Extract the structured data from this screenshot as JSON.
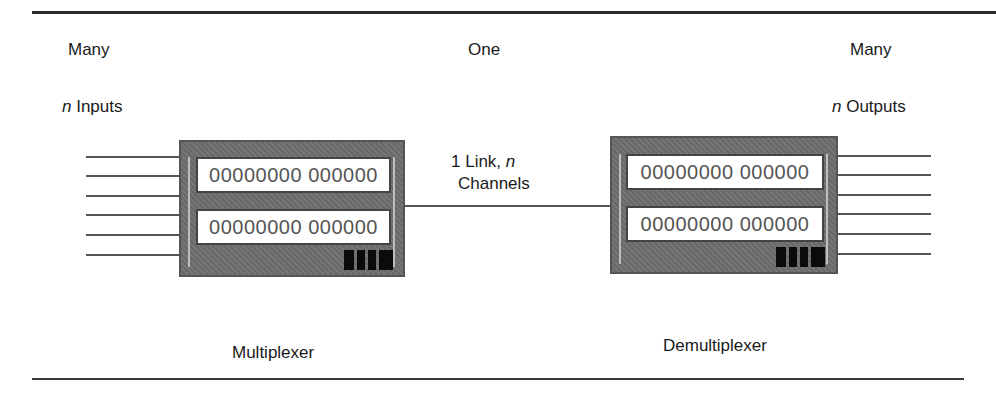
{
  "labels": {
    "left_top": "Many",
    "center_top": "One",
    "right_top": "Many",
    "inputs_prefix": "n",
    "inputs_text": " Inputs",
    "outputs_prefix": "n",
    "outputs_text": " Outputs",
    "link_line1_text": "1 Link, ",
    "link_line1_var": "n",
    "link_line2": "Channels",
    "mux_caption": "Multiplexer",
    "demux_caption": "Demultiplexer"
  },
  "multiplexer": {
    "panel1": "00000000 000000",
    "panel2": "00000000 000000",
    "input_line_count": 6
  },
  "demultiplexer": {
    "panel1": "00000000 000000",
    "panel2": "00000000 000000",
    "output_line_count": 6
  },
  "colors": {
    "device_body": "#6e6e6e",
    "panel_bg": "#ffffff",
    "rule": "#2a2a2a"
  }
}
